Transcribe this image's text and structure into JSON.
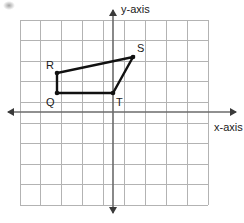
{
  "figure": {
    "type": "coordinate-grid-polygon",
    "axes": {
      "x_label": "x-axis",
      "y_label": "y-axis",
      "x_axis_y_px": 112,
      "y_axis_x_px": 113,
      "arrows": [
        "left",
        "right",
        "up",
        "down"
      ]
    },
    "grid": {
      "left_px": 20,
      "top_px": 20,
      "right_px": 208,
      "bottom_px": 205,
      "cols": 9,
      "rows": 9,
      "cell_w_px": 20.9,
      "cell_h_px": 20.6,
      "line_color": "#b3b3b3",
      "show": true
    },
    "polygon": {
      "name": "QRST",
      "fill": "none",
      "stroke_color": "#111111",
      "stroke_width_px": 2.4,
      "vertices": [
        {
          "label": "Q",
          "x_units": -2.7,
          "y_units": 0.9,
          "px_x": 57,
          "px_y": 93,
          "label_dx": -11,
          "label_dy": 4,
          "dot": true
        },
        {
          "label": "R",
          "x_units": -2.7,
          "y_units": 1.9,
          "px_x": 57,
          "px_y": 73,
          "label_dx": -11,
          "label_dy": -13,
          "dot": true
        },
        {
          "label": "S",
          "x_units": 1.0,
          "y_units": 2.7,
          "px_x": 133,
          "px_y": 57,
          "label_dx": 4,
          "label_dy": -14,
          "dot": true
        },
        {
          "label": "T",
          "x_units": 0.0,
          "y_units": 0.9,
          "px_x": 113,
          "px_y": 93,
          "label_dx": 3,
          "label_dy": 4,
          "dot": true
        }
      ]
    },
    "colors": {
      "background": "#ffffff",
      "grid": "#b3b3b3",
      "axis": "#6b6b6b",
      "ink": "#111111"
    }
  }
}
